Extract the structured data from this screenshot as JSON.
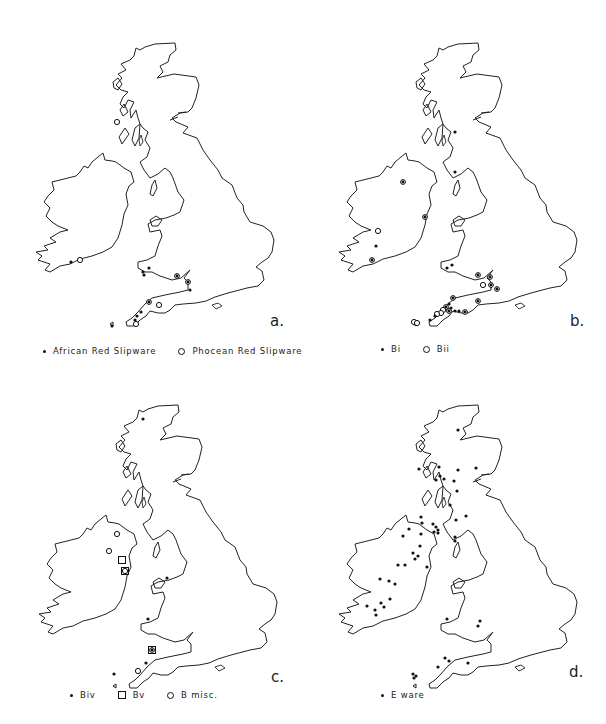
{
  "figure": {
    "panels": [
      {
        "id": "a",
        "letter": "a.",
        "offset": [
          0,
          0
        ],
        "legend": [
          {
            "symbol": "dot",
            "label": "African Red Slipware"
          },
          {
            "symbol": "circle",
            "label": "Phocean Red Slipware"
          }
        ],
        "markers": [
          {
            "type": "circle",
            "x": 117,
            "y": 122
          },
          {
            "type": "dot",
            "x": 71,
            "y": 262
          },
          {
            "type": "circle",
            "x": 80,
            "y": 260
          },
          {
            "type": "dot",
            "x": 143,
            "y": 272
          },
          {
            "type": "dot",
            "x": 149,
            "y": 268
          },
          {
            "type": "dot",
            "x": 144,
            "y": 275
          },
          {
            "type": "circdot",
            "x": 177,
            "y": 276
          },
          {
            "type": "circdot",
            "x": 188,
            "y": 282
          },
          {
            "type": "dot",
            "x": 190,
            "y": 290
          },
          {
            "type": "circdot",
            "x": 149,
            "y": 302
          },
          {
            "type": "circle",
            "x": 159,
            "y": 305
          },
          {
            "type": "dot",
            "x": 141,
            "y": 312
          },
          {
            "type": "dot",
            "x": 137,
            "y": 316
          },
          {
            "type": "dot",
            "x": 135,
            "y": 320
          },
          {
            "type": "circle",
            "x": 136,
            "y": 324
          },
          {
            "type": "dot",
            "x": 112,
            "y": 326
          }
        ]
      },
      {
        "id": "b",
        "letter": "b.",
        "offset": [
          303,
          0
        ],
        "legend": [
          {
            "symbol": "dot",
            "label": "Bi"
          },
          {
            "symbol": "circle",
            "label": "Bii"
          }
        ],
        "markers": [
          {
            "type": "dot",
            "x": 152,
            "y": 132
          },
          {
            "type": "dot",
            "x": 152,
            "y": 172
          },
          {
            "type": "circdot",
            "x": 100,
            "y": 182
          },
          {
            "type": "circdot",
            "x": 122,
            "y": 217
          },
          {
            "type": "circle",
            "x": 75,
            "y": 231
          },
          {
            "type": "dot",
            "x": 73,
            "y": 246
          },
          {
            "type": "circdot",
            "x": 69,
            "y": 260
          },
          {
            "type": "dot",
            "x": 144,
            "y": 268
          },
          {
            "type": "dot",
            "x": 149,
            "y": 265
          },
          {
            "type": "circdot",
            "x": 175,
            "y": 275
          },
          {
            "type": "circdot",
            "x": 187,
            "y": 277
          },
          {
            "type": "circle",
            "x": 180,
            "y": 285
          },
          {
            "type": "circdot",
            "x": 188,
            "y": 285
          },
          {
            "type": "circdot",
            "x": 194,
            "y": 289
          },
          {
            "type": "circdot",
            "x": 150,
            "y": 298
          },
          {
            "type": "circdot",
            "x": 175,
            "y": 301
          },
          {
            "type": "dot",
            "x": 146,
            "y": 304
          },
          {
            "type": "circdot",
            "x": 143,
            "y": 307
          },
          {
            "type": "dot",
            "x": 148,
            "y": 308
          },
          {
            "type": "circle",
            "x": 140,
            "y": 310
          },
          {
            "type": "circdot",
            "x": 146,
            "y": 311
          },
          {
            "type": "dot",
            "x": 152,
            "y": 311
          },
          {
            "type": "dot",
            "x": 156,
            "y": 311
          },
          {
            "type": "circle",
            "x": 138,
            "y": 313
          },
          {
            "type": "circle",
            "x": 134,
            "y": 314
          },
          {
            "type": "circdot",
            "x": 162,
            "y": 312
          },
          {
            "type": "dot",
            "x": 132,
            "y": 316
          },
          {
            "type": "dot",
            "x": 127,
            "y": 320
          },
          {
            "type": "circle",
            "x": 111,
            "y": 322
          },
          {
            "type": "circle",
            "x": 114,
            "y": 323
          }
        ]
      },
      {
        "id": "c",
        "letter": "c.",
        "offset": [
          3,
          362
        ],
        "legend": [
          {
            "symbol": "dot",
            "label": "Biv"
          },
          {
            "symbol": "square",
            "label": "Bv"
          },
          {
            "symbol": "circle",
            "label": "B misc."
          }
        ],
        "markers": [
          {
            "type": "dot",
            "x": 140,
            "y": 57
          },
          {
            "type": "circle",
            "x": 114,
            "y": 172
          },
          {
            "type": "circle",
            "x": 106,
            "y": 189
          },
          {
            "type": "square",
            "x": 119,
            "y": 198
          },
          {
            "type": "square",
            "x": 122,
            "y": 209
          },
          {
            "type": "circle",
            "x": 122,
            "y": 209
          },
          {
            "type": "dot",
            "x": 164,
            "y": 216
          },
          {
            "type": "dot",
            "x": 145,
            "y": 257
          },
          {
            "type": "square",
            "x": 149,
            "y": 288
          },
          {
            "type": "circdot",
            "x": 149,
            "y": 288
          },
          {
            "type": "dot",
            "x": 143,
            "y": 301
          },
          {
            "type": "circle",
            "x": 135,
            "y": 309
          },
          {
            "type": "dot",
            "x": 111,
            "y": 312
          }
        ]
      },
      {
        "id": "d",
        "letter": "d.",
        "offset": [
          303,
          362
        ],
        "legend": [
          {
            "symbol": "dot",
            "label": "E ware"
          }
        ],
        "markers": [
          {
            "type": "dot",
            "x": 155,
            "y": 68
          },
          {
            "type": "dot",
            "x": 116,
            "y": 107
          },
          {
            "type": "dot",
            "x": 136,
            "y": 105
          },
          {
            "type": "dot",
            "x": 155,
            "y": 108
          },
          {
            "type": "dot",
            "x": 173,
            "y": 106
          },
          {
            "type": "dot",
            "x": 133,
            "y": 118
          },
          {
            "type": "dot",
            "x": 137,
            "y": 114
          },
          {
            "type": "dot",
            "x": 141,
            "y": 117
          },
          {
            "type": "dot",
            "x": 151,
            "y": 119
          },
          {
            "type": "dot",
            "x": 154,
            "y": 129
          },
          {
            "type": "dot",
            "x": 147,
            "y": 143
          },
          {
            "type": "dot",
            "x": 118,
            "y": 155
          },
          {
            "type": "dot",
            "x": 153,
            "y": 158
          },
          {
            "type": "dot",
            "x": 163,
            "y": 154
          },
          {
            "type": "dot",
            "x": 119,
            "y": 161
          },
          {
            "type": "dot",
            "x": 130,
            "y": 162
          },
          {
            "type": "dot",
            "x": 133,
            "y": 165
          },
          {
            "type": "dot",
            "x": 135,
            "y": 168
          },
          {
            "type": "dot",
            "x": 131,
            "y": 170
          },
          {
            "type": "dot",
            "x": 135,
            "y": 171
          },
          {
            "type": "dot",
            "x": 152,
            "y": 175
          },
          {
            "type": "dot",
            "x": 152,
            "y": 179
          },
          {
            "type": "dot",
            "x": 106,
            "y": 167
          },
          {
            "type": "dot",
            "x": 118,
            "y": 172
          },
          {
            "type": "dot",
            "x": 100,
            "y": 174
          },
          {
            "type": "dot",
            "x": 117,
            "y": 184
          },
          {
            "type": "dot",
            "x": 110,
            "y": 191
          },
          {
            "type": "dot",
            "x": 115,
            "y": 194
          },
          {
            "type": "dot",
            "x": 112,
            "y": 197
          },
          {
            "type": "dot",
            "x": 95,
            "y": 203
          },
          {
            "type": "dot",
            "x": 102,
            "y": 203
          },
          {
            "type": "dot",
            "x": 124,
            "y": 205
          },
          {
            "type": "dot",
            "x": 77,
            "y": 217
          },
          {
            "type": "dot",
            "x": 86,
            "y": 219
          },
          {
            "type": "dot",
            "x": 92,
            "y": 222
          },
          {
            "type": "dot",
            "x": 87,
            "y": 237
          },
          {
            "type": "dot",
            "x": 78,
            "y": 241
          },
          {
            "type": "dot",
            "x": 64,
            "y": 244
          },
          {
            "type": "dot",
            "x": 72,
            "y": 248
          },
          {
            "type": "dot",
            "x": 81,
            "y": 245
          },
          {
            "type": "dot",
            "x": 73,
            "y": 253
          },
          {
            "type": "dot",
            "x": 144,
            "y": 257
          },
          {
            "type": "dot",
            "x": 177,
            "y": 259
          },
          {
            "type": "dot",
            "x": 175,
            "y": 264
          },
          {
            "type": "dot",
            "x": 142,
            "y": 296
          },
          {
            "type": "dot",
            "x": 146,
            "y": 299
          },
          {
            "type": "dot",
            "x": 165,
            "y": 301
          },
          {
            "type": "dot",
            "x": 135,
            "y": 305
          },
          {
            "type": "dot",
            "x": 110,
            "y": 312
          },
          {
            "type": "dot",
            "x": 113,
            "y": 314
          },
          {
            "type": "dot",
            "x": 111,
            "y": 316
          }
        ]
      }
    ]
  }
}
